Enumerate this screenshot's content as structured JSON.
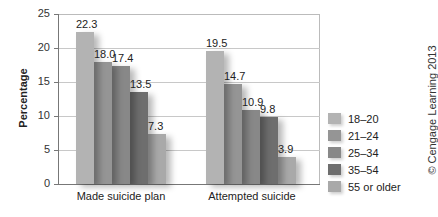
{
  "chart_data": {
    "type": "bar",
    "title": "",
    "xlabel": "",
    "ylabel": "Percentage",
    "ylim": [
      0,
      25
    ],
    "yticks": [
      0,
      5,
      10,
      15,
      20,
      25
    ],
    "grid": true,
    "legend_position": "right",
    "categories": [
      "Made suicide plan",
      "Attempted suicide"
    ],
    "series": [
      {
        "name": "18–20",
        "values": [
          22.3,
          19.5
        ],
        "color": "#b3b3b3"
      },
      {
        "name": "21–24",
        "values": [
          18.0,
          14.7
        ],
        "color": "#959595"
      },
      {
        "name": "25–34",
        "values": [
          17.4,
          10.9
        ],
        "color": "#888888"
      },
      {
        "name": "35–54",
        "values": [
          13.5,
          9.8
        ],
        "color": "#6e6e6e"
      },
      {
        "name": "55 or older",
        "values": [
          7.3,
          3.9
        ],
        "color": "#a9a9a9"
      }
    ],
    "value_labels": [
      [
        "22.3",
        "18.0",
        "17.4",
        "13.5",
        "7.3"
      ],
      [
        "19.5",
        "14.7",
        "10.9",
        "9.8",
        "3.9"
      ]
    ],
    "annotation": "© Cengage Learning 2013"
  },
  "axis": {
    "ylabel": "Percentage",
    "ticks": [
      "0",
      "5",
      "10",
      "15",
      "20",
      "25"
    ]
  },
  "categories": [
    "Made suicide plan",
    "Attempted suicide"
  ],
  "legend": [
    "18–20",
    "21–24",
    "25–34",
    "35–54",
    "55 or older"
  ],
  "credit": "© Cengage Learning 2013"
}
